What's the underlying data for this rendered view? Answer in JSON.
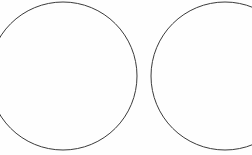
{
  "figure": {
    "canvas": {
      "width": 252,
      "height": 155,
      "background_color": "#fefefe"
    },
    "style": {
      "stroke_color": "#3a3a3a",
      "stroke_width": 1,
      "fill": "none"
    },
    "shapes": [
      {
        "name": "left-circle",
        "type": "circle",
        "cx": 63,
        "cy": 76,
        "r": 74,
        "clipped_edges": "left",
        "label": "Left circle"
      },
      {
        "name": "right-circle",
        "type": "circle",
        "cx": 225,
        "cy": 76,
        "r": 74,
        "clipped_edges": "right",
        "label": "Right circle"
      }
    ]
  }
}
